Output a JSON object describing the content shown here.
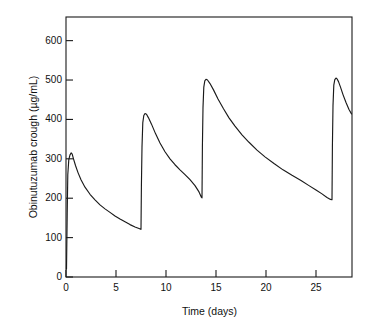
{
  "figure": {
    "background": "#ffffff",
    "line_color": "#1a1a1a",
    "axis_color": "#1a1a1a"
  },
  "chart_data": {
    "type": "line",
    "title": "",
    "subtitle": "",
    "xlabel": "Time (days)",
    "ylabel": "Obinutuzumab crough (µg/mL)",
    "xlim": [
      0,
      28.6
    ],
    "ylim": [
      0,
      660
    ],
    "xticks": [
      0,
      5,
      10,
      15,
      20,
      25
    ],
    "xtick_labels": [
      "0",
      "5",
      "10",
      "15",
      "20",
      "25"
    ],
    "yticks": [
      0,
      100,
      200,
      300,
      400,
      500,
      600
    ],
    "ytick_labels": [
      "0",
      "100",
      "200",
      "300",
      "400",
      "500",
      "600"
    ],
    "grid": false,
    "legend": null,
    "legend_position": "none",
    "annotations": [],
    "series": [
      {
        "name": "Obinutuzumab concentration",
        "color": "#1a1a1a",
        "dose_days": [
          0.1,
          7.5,
          13.6,
          26.6
        ],
        "peak_values": [
          315,
          415,
          502,
          505
        ],
        "trough_values": [
          120,
          200,
          197,
          413
        ],
        "points": [
          [
            0.05,
            20
          ],
          [
            0.12,
            160
          ],
          [
            0.18,
            260
          ],
          [
            0.28,
            298
          ],
          [
            0.4,
            310
          ],
          [
            0.52,
            315
          ],
          [
            0.62,
            312
          ],
          [
            0.75,
            300
          ],
          [
            0.95,
            283
          ],
          [
            1.2,
            265
          ],
          [
            1.5,
            247
          ],
          [
            1.9,
            228
          ],
          [
            2.4,
            210
          ],
          [
            2.9,
            196
          ],
          [
            3.4,
            183
          ],
          [
            3.9,
            173
          ],
          [
            4.4,
            164
          ],
          [
            4.9,
            155
          ],
          [
            5.4,
            147
          ],
          [
            5.9,
            140
          ],
          [
            6.4,
            133
          ],
          [
            6.9,
            127
          ],
          [
            7.3,
            123
          ],
          [
            7.48,
            121
          ],
          [
            7.5,
            121
          ],
          [
            7.54,
            230
          ],
          [
            7.6,
            330
          ],
          [
            7.68,
            392
          ],
          [
            7.78,
            410
          ],
          [
            7.9,
            415
          ],
          [
            8.05,
            413
          ],
          [
            8.25,
            404
          ],
          [
            8.55,
            388
          ],
          [
            8.95,
            364
          ],
          [
            9.4,
            340
          ],
          [
            9.9,
            318
          ],
          [
            10.4,
            300
          ],
          [
            10.9,
            285
          ],
          [
            11.4,
            272
          ],
          [
            11.9,
            260
          ],
          [
            12.4,
            247
          ],
          [
            12.9,
            232
          ],
          [
            13.3,
            216
          ],
          [
            13.55,
            202
          ],
          [
            13.6,
            201
          ],
          [
            13.64,
            330
          ],
          [
            13.7,
            430
          ],
          [
            13.78,
            482
          ],
          [
            13.88,
            498
          ],
          [
            14.0,
            502
          ],
          [
            14.15,
            500
          ],
          [
            14.4,
            491
          ],
          [
            14.75,
            475
          ],
          [
            15.2,
            452
          ],
          [
            15.75,
            427
          ],
          [
            16.3,
            404
          ],
          [
            16.9,
            383
          ],
          [
            17.6,
            361
          ],
          [
            18.3,
            342
          ],
          [
            19.1,
            322
          ],
          [
            19.9,
            305
          ],
          [
            20.8,
            288
          ],
          [
            21.7,
            272
          ],
          [
            22.6,
            258
          ],
          [
            23.5,
            245
          ],
          [
            24.3,
            232
          ],
          [
            25.0,
            221
          ],
          [
            25.6,
            211
          ],
          [
            26.1,
            202
          ],
          [
            26.45,
            197
          ],
          [
            26.58,
            196
          ],
          [
            26.6,
            196
          ],
          [
            26.64,
            330
          ],
          [
            26.7,
            435
          ],
          [
            26.78,
            487
          ],
          [
            26.88,
            501
          ],
          [
            27.0,
            505
          ],
          [
            27.1,
            503
          ],
          [
            27.25,
            496
          ],
          [
            27.45,
            482
          ],
          [
            27.7,
            463
          ],
          [
            28.0,
            443
          ],
          [
            28.3,
            425
          ],
          [
            28.55,
            414
          ]
        ]
      }
    ]
  }
}
